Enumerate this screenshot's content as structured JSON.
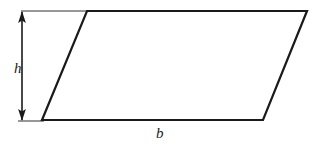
{
  "figure": {
    "type": "geometry-diagram",
    "shape": "parallelogram",
    "background_color": "#ffffff",
    "stroke_color": "#1a1a1a",
    "shape_stroke_width": 2.2,
    "guide_stroke_width": 0.9,
    "arrow_stroke_width": 1.6,
    "labels": {
      "height": "h",
      "base": "b"
    },
    "geometry": {
      "parallelogram_points": "87,11 307,11 263,120 42,120",
      "vertices": [
        {
          "name": "top-left",
          "x": 87,
          "y": 11
        },
        {
          "name": "top-right",
          "x": 307,
          "y": 11
        },
        {
          "name": "bottom-right",
          "x": 263,
          "y": 120
        },
        {
          "name": "bottom-left",
          "x": 42,
          "y": 120
        }
      ],
      "height_arrow": {
        "x": 22,
        "y_top": 11,
        "y_bottom": 121,
        "arrowheads": "both"
      },
      "top_guide_line": {
        "x1": 21,
        "x2": 88,
        "y": 11
      },
      "bottom_guide_line": {
        "x1": 18,
        "x2": 44,
        "y": 121
      }
    }
  }
}
